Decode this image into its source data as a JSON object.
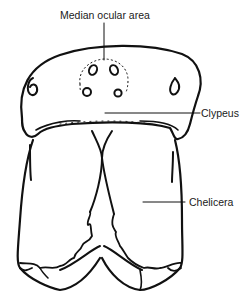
{
  "diagram": {
    "type": "anatomical line drawing",
    "stroke_color": "#111111",
    "background": "#ffffff",
    "labels": [
      {
        "id": "median-ocular-area",
        "text": "Median ocular area"
      },
      {
        "id": "clypeus",
        "text": "Clypeus"
      },
      {
        "id": "chelicera",
        "text": "Chelicera"
      }
    ]
  }
}
